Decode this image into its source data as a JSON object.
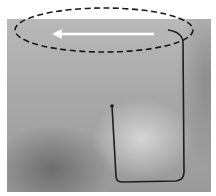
{
  "image": {
    "description": "Grayscale photograph with annotation overlay",
    "annotations": {
      "ellipse": {
        "style": "dashed",
        "color": "#1a1a1a"
      },
      "arrow": {
        "direction": "left",
        "color": "#ffffff"
      },
      "wire_path": {
        "color": "#1e1e1e"
      }
    }
  }
}
